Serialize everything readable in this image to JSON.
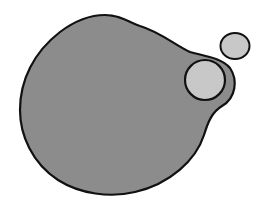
{
  "diagram": {
    "colors": {
      "background": "#ffffff",
      "blob_fill": "#8c8c8c",
      "circle_fill": "#c8c8c8",
      "outline": "#111111"
    },
    "shapes": [
      {
        "id": "main-blob",
        "type": "blob",
        "fill": "#8c8c8c"
      },
      {
        "id": "inner-circle",
        "type": "circle",
        "cx": 205,
        "cy": 80,
        "r": 20,
        "fill": "#c8c8c8"
      },
      {
        "id": "small-circle",
        "type": "ellipse",
        "cx": 235,
        "cy": 46,
        "rx": 15,
        "ry": 13,
        "fill": "#c8c8c8"
      }
    ]
  }
}
